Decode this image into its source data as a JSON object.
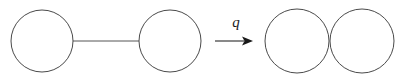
{
  "figure": {
    "width": 403,
    "height": 78,
    "background_color": "#ffffff",
    "stroke_color": "#4a4a4a",
    "edge_color": "#555555",
    "arrow_color": "#1a1a1a"
  },
  "left_graph": {
    "name": "graph-before-contraction",
    "nodes": [
      {
        "id": "node-left-1",
        "label": "",
        "cx": 42,
        "cy": 41,
        "r": 31
      },
      {
        "id": "node-left-2",
        "label": "",
        "cx": 170,
        "cy": 41,
        "r": 31
      }
    ],
    "edges": [
      {
        "id": "edge-left-1",
        "label": "",
        "x1": 73,
        "y1": 41,
        "x2": 139,
        "y2": 41
      }
    ]
  },
  "operator": {
    "name": "contraction-operator",
    "label": "q",
    "label_x": 236,
    "label_y": 27,
    "arrow": {
      "x1": 215,
      "y1": 41,
      "x2": 253,
      "y2": 41,
      "head_length": 11,
      "head_width": 9
    }
  },
  "right_graph": {
    "name": "graph-after-contraction",
    "nodes": [
      {
        "id": "node-right-1",
        "label": "",
        "cx": 297,
        "cy": 41,
        "r": 32
      },
      {
        "id": "node-right-2",
        "label": "",
        "cx": 362,
        "cy": 41,
        "r": 32
      }
    ],
    "edges": []
  }
}
